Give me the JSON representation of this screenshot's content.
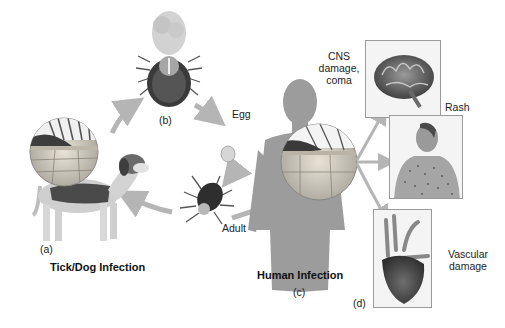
{
  "figure": {
    "left_section": {
      "title": "Tick/Dog Infection",
      "panel_label": "(a)",
      "tick_panel_label": "(b)",
      "lifecycle_labels": {
        "egg": "Egg",
        "adult": "Adult"
      }
    },
    "right_section": {
      "title": "Human Infection",
      "panel_label": "(c)",
      "outcomes_panel_label": "(d)",
      "outcomes": [
        {
          "label_lines": [
            "CNS",
            "damage,",
            "coma"
          ],
          "icon": "brain-icon"
        },
        {
          "label_lines": [
            "Rash"
          ],
          "icon": "rash-torso-icon"
        },
        {
          "label_lines": [
            "Vascular",
            "damage"
          ],
          "icon": "heart-icon"
        }
      ]
    },
    "colors": {
      "arrow": "#b5b5b5",
      "human_silhouette": "#9c9c9c",
      "tick_body": "#3a3a3a",
      "panel_border": "#9a9a9a"
    }
  }
}
